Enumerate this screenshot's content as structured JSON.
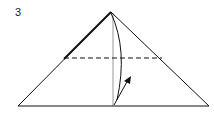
{
  "diagram": {
    "step_number": "3",
    "type": "origami-fold-instruction",
    "colors": {
      "line": "#111111",
      "center_crease": "#999999",
      "background": "#ffffff"
    },
    "elements": {
      "triangle": {
        "apex": [
          111,
          12
        ],
        "base_left": [
          18,
          106
        ],
        "base_right": [
          209,
          106
        ]
      },
      "valley_fold_line": {
        "style": "dashed",
        "y": 58,
        "x_start": 64,
        "x_end": 162
      },
      "center_crease": {
        "x": 113,
        "y_start": 12,
        "y_end": 106
      },
      "fold_arrow": {
        "from": [
          114,
          105
        ],
        "to": [
          130,
          77
        ]
      }
    }
  }
}
